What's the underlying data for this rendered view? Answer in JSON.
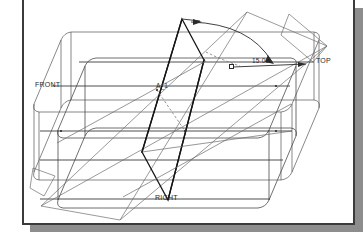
{
  "window": {
    "title": "CAD Datum Plane Rotation View",
    "background_color": "#ffffff",
    "frame_border_color": "#3b3b3b",
    "shadow_color": "#8d8d8d"
  },
  "drawing": {
    "description": "Isometric wireframe of a rounded rectangular block with datum planes",
    "line_color": "#3f3f3f",
    "emphasis_color": "#1e1e1e",
    "dashed_color": "#6b6b6b",
    "labels": [
      {
        "name": "datum-top",
        "text": "TOP",
        "x": 316,
        "y": 62
      },
      {
        "name": "datum-front",
        "text": "FRONT",
        "x": 35,
        "y": 86
      },
      {
        "name": "datum-right",
        "text": "RIGHT",
        "x": 155,
        "y": 199
      },
      {
        "name": "datum-a1",
        "text": "A_1",
        "x": 155,
        "y": 87
      }
    ],
    "dimension": {
      "name": "angle-dimension",
      "value": "15.00",
      "x": 250,
      "y": 60,
      "handle": {
        "x": 231,
        "y": 65
      }
    }
  }
}
